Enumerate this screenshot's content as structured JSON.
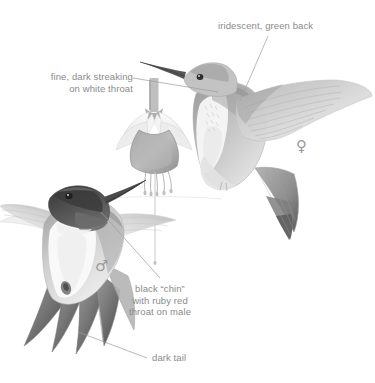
{
  "plate": {
    "title": "Ruby-throated Hummingbird field guide plate",
    "background_color": "#ffffff",
    "ink_color": "#8a8a8a",
    "style": "graphite pencil illustration, grayscale"
  },
  "labels": [
    {
      "name": "iridescent-green-back",
      "text": "iridescent, green back",
      "align": "left",
      "x": 218,
      "y": 20,
      "leader": {
        "x1": 268,
        "y1": 36,
        "x2": 240,
        "y2": 101
      }
    },
    {
      "name": "fine-dark-streaking",
      "text": "fine, dark streaking\non white throat",
      "align": "right",
      "x": 40,
      "y": 71,
      "leader": {
        "x1": 133,
        "y1": 78,
        "x2": 218,
        "y2": 92
      }
    },
    {
      "name": "black-chin-ruby-throat",
      "text": "black “chin”\nwith ruby red\nthroat on male",
      "align": "center",
      "x": 105,
      "y": 283,
      "leader": {
        "x1": 101,
        "y1": 212,
        "x2": 160,
        "y2": 278
      }
    },
    {
      "name": "dark-tail",
      "text": "dark tail",
      "align": "left",
      "x": 149,
      "y": 352,
      "leader": {
        "x1": 78,
        "y1": 332,
        "x2": 147,
        "y2": 358
      }
    }
  ],
  "sex_symbols": [
    {
      "name": "female-symbol",
      "glyph": "♀",
      "x": 296,
      "y": 139,
      "refers_to": "female hummingbird"
    },
    {
      "name": "male-symbol",
      "glyph": "♂",
      "x": 95,
      "y": 259,
      "refers_to": "male hummingbird"
    }
  ],
  "subjects": [
    {
      "name": "female-hummingbird",
      "sex": "female",
      "description": "hovering hummingbird, upper right, green back, white throat, spread wing, dark-tipped tail"
    },
    {
      "name": "male-hummingbird",
      "sex": "male",
      "description": "hovering hummingbird, lower left, black chin with ruby throat, dark forked tail, bill in flower"
    },
    {
      "name": "fuchsia-flower",
      "description": "pendant fuchsia blossom at center with pink sepals, dark corolla and stamens"
    }
  ]
}
